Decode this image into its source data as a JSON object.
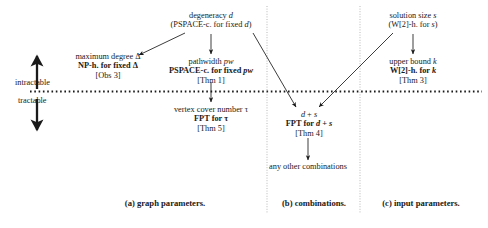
{
  "figure": {
    "bands": {
      "intractable_label": "intractable",
      "tractable_label": "tractable"
    },
    "nodes": {
      "max_degree": {
        "line1": "maximum degree Δ",
        "line2": "NP-h. for fixed Δ",
        "line3": "[Obs 3]"
      },
      "degeneracy": {
        "line1": "degeneracy d",
        "line2": "(PSPACE-c. for fixed d)"
      },
      "pathwidth": {
        "line1": "pathwidth pw",
        "line2": "PSPACE-c. for fixed pw",
        "line3": "[Thm 1]"
      },
      "vertex_cover": {
        "line1": "vertex cover number τ",
        "line2": "FPT for τ",
        "line3": "[Thm 5]"
      },
      "solution_size": {
        "line1": "solution size s",
        "line2": "(W[2]-h. for s)"
      },
      "upper_bound": {
        "line1": "upper bound k",
        "line2": "W[2]-h. for k",
        "line3": "[Thm 3]"
      },
      "d_plus_s": {
        "line1": "d + s",
        "line2": "FPT for d + s",
        "line3": "[Thm 4]"
      },
      "any_other": {
        "line1": "any",
        "line2": "other combinations"
      }
    },
    "captions": {
      "a": "(a) graph parameters.",
      "b": "(b) combinations.",
      "c": "(c) input parameters."
    },
    "colors": {
      "ink": "#1a1a1a",
      "divider": "#b8b8b8",
      "background": "#ffffff"
    }
  }
}
